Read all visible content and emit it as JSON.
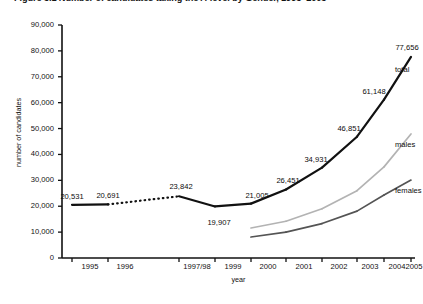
{
  "figure": {
    "title": "Figure 3.1  Number of candidates taking the A-level by Gender, 1995–2005"
  },
  "chart_data": {
    "type": "line",
    "title": "Figure 3.1  Number of candidates taking the A-level by Gender, 1995–2005",
    "xlabel": "year",
    "ylabel": "number of candidates",
    "categories": [
      "1995",
      "1996",
      "1997/98",
      "1999",
      "2000",
      "2001",
      "2002",
      "2003",
      "2004",
      "2005"
    ],
    "ylim": [
      0,
      90000
    ],
    "ytick_values": [
      0,
      10000,
      20000,
      30000,
      40000,
      50000,
      60000,
      70000,
      80000,
      90000
    ],
    "ytick_labels": [
      "0",
      "10,000",
      "20,000",
      "30,000",
      "40,000",
      "50,000",
      "60,000",
      "70,000",
      "80,000",
      "90,000"
    ],
    "grid": false,
    "legend": "inline-annotations",
    "series": [
      {
        "name": "total",
        "color": "#111111",
        "width": 2.2,
        "values": [
          20531,
          20691,
          23842,
          19907,
          21005,
          26451,
          34931,
          46851,
          61148,
          77656
        ],
        "dashed_segments": [
          [
            1,
            2
          ]
        ],
        "labels": [
          "20,531",
          "20,691",
          "23,842",
          "19,907",
          "21,005",
          "26,451",
          "34,931",
          "46,851",
          "61,148",
          "77,656"
        ]
      },
      {
        "name": "males",
        "color": "#b3b3b3",
        "width": 1.7,
        "values": [
          null,
          null,
          null,
          null,
          11600,
          14200,
          19000,
          26000,
          35200,
          47900
        ],
        "labels": [
          null,
          null,
          null,
          null,
          null,
          null,
          null,
          null,
          null,
          null
        ]
      },
      {
        "name": "females",
        "color": "#545454",
        "width": 1.7,
        "values": [
          null,
          null,
          null,
          null,
          8100,
          10000,
          13300,
          18100,
          24300,
          30100
        ],
        "labels": [
          null,
          null,
          null,
          null,
          null,
          null,
          null,
          null,
          null,
          null
        ]
      }
    ],
    "annotations": [
      {
        "text": "total",
        "series": "total",
        "x": "2005"
      },
      {
        "text": "males",
        "series": "males",
        "x": "2005"
      },
      {
        "text": "females",
        "series": "females",
        "x": "2005"
      }
    ]
  },
  "axis": {
    "y_title": "number of candidates",
    "x_title": "year"
  }
}
